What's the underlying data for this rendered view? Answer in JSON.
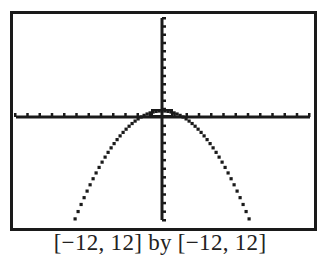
{
  "caption": "[−12, 12] by [−12, 12]",
  "chart_data": {
    "type": "line",
    "title": "",
    "caption": "[−12, 12] by [−12, 12]",
    "xlabel": "",
    "ylabel": "",
    "xlim": [
      -12,
      12
    ],
    "ylim": [
      -12,
      12
    ],
    "xscl": 1,
    "yscl": 1,
    "grid": false,
    "legend": "none",
    "series": [
      {
        "name": "y = -0.25x^2 + 0.75 (approx.)",
        "x": [
          -7.1,
          -6,
          -5,
          -4,
          -3,
          -2,
          -1.73,
          -1,
          0,
          1,
          1.73,
          2,
          3,
          4,
          5,
          6,
          7.1
        ],
        "y": [
          -11.85,
          -8.25,
          -5.5,
          -3.25,
          -1.5,
          -0.25,
          0,
          0.5,
          0.75,
          0.5,
          0,
          -0.25,
          -1.5,
          -3.25,
          -5.5,
          -8.25,
          -11.85
        ]
      }
    ],
    "annotations": [
      "small rectangular trace cursor near the vertex (0, 0.5)"
    ]
  },
  "colors": {
    "ink": "#1a1a1a",
    "background": "#ffffff"
  }
}
